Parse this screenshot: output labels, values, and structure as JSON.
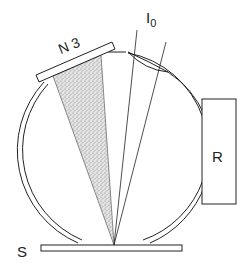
{
  "figure": {
    "type": "schematic",
    "labels": {
      "beam": "I",
      "beam_subscript": "0",
      "port_cap": "N 3",
      "reference": "R",
      "sample": "S"
    },
    "colors": {
      "stroke": "#222222",
      "shading": "#9a9a9a",
      "background": "#ffffff"
    }
  }
}
